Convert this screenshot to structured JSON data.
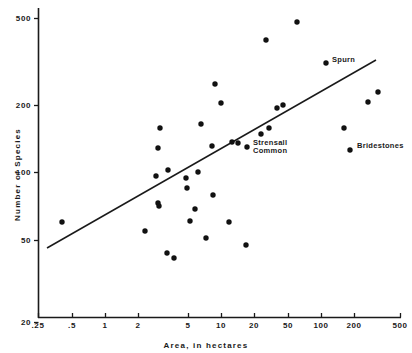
{
  "chart_data": {
    "type": "scatter",
    "title": "",
    "xlabel": "Area, in hectares",
    "ylabel": "Number of Species",
    "xscale": "log",
    "yscale": "log",
    "xlim": [
      0.25,
      500
    ],
    "ylim": [
      20,
      500
    ],
    "grid": false,
    "legend": null,
    "xticks": [
      {
        "value": 0.25,
        "label": ".25",
        "px": 38
      },
      {
        "value": 0.5,
        "label": ".5",
        "px": 72
      },
      {
        "value": 1,
        "label": "1",
        "px": 105
      },
      {
        "value": 2,
        "label": "2",
        "px": 138
      },
      {
        "value": 5,
        "label": "5",
        "px": 188
      },
      {
        "value": 10,
        "label": "10",
        "px": 221
      },
      {
        "value": 20,
        "label": "20",
        "px": 254
      },
      {
        "value": 50,
        "label": "50",
        "px": 288
      },
      {
        "value": 100,
        "label": "100",
        "px": 321
      },
      {
        "value": 200,
        "label": "200",
        "px": 354
      },
      {
        "value": 500,
        "label": "500",
        "px": 400
      }
    ],
    "yticks": [
      {
        "value": 500,
        "label": "500",
        "px": 18
      },
      {
        "value": 200,
        "label": "200",
        "px": 105
      },
      {
        "value": 100,
        "label": "100",
        "px": 172
      },
      {
        "value": 50,
        "label": "50",
        "px": 240
      },
      {
        "value": 20,
        "label": "20",
        "px": 322
      }
    ],
    "points": [
      {
        "x": 0.4,
        "y": 65,
        "px": 62,
        "py": 222,
        "label": null
      },
      {
        "x": 2.4,
        "y": 59,
        "px": 145,
        "py": 231,
        "label": null
      },
      {
        "x": 3.0,
        "y": 96,
        "px": 156,
        "py": 176,
        "label": null
      },
      {
        "x": 3.1,
        "y": 76,
        "px": 158,
        "py": 203,
        "label": null
      },
      {
        "x": 3.1,
        "y": 74,
        "px": 159,
        "py": 206,
        "label": null
      },
      {
        "x": 3.2,
        "y": 155,
        "px": 160,
        "py": 128,
        "label": null
      },
      {
        "x": 3.1,
        "y": 124,
        "px": 158,
        "py": 148,
        "label": null
      },
      {
        "x": 3.9,
        "y": 101,
        "px": 168,
        "py": 170,
        "label": null
      },
      {
        "x": 3.8,
        "y": 42,
        "px": 167,
        "py": 253,
        "label": null
      },
      {
        "x": 4.5,
        "y": 38,
        "px": 174,
        "py": 258,
        "label": null
      },
      {
        "x": 5.6,
        "y": 94,
        "px": 186,
        "py": 178,
        "label": null
      },
      {
        "x": 5.7,
        "y": 86,
        "px": 187,
        "py": 188,
        "label": null
      },
      {
        "x": 6.2,
        "y": 65,
        "px": 190,
        "py": 221,
        "label": null
      },
      {
        "x": 6.9,
        "y": 73,
        "px": 195,
        "py": 209,
        "label": null
      },
      {
        "x": 7.4,
        "y": 99,
        "px": 198,
        "py": 172,
        "label": null
      },
      {
        "x": 7.9,
        "y": 163,
        "px": 201,
        "py": 124,
        "label": null
      },
      {
        "x": 9.0,
        "y": 51,
        "px": 206,
        "py": 238,
        "label": null
      },
      {
        "x": 10.5,
        "y": 81,
        "px": 213,
        "py": 195,
        "label": null
      },
      {
        "x": 10.2,
        "y": 127,
        "px": 212,
        "py": 146,
        "label": null
      },
      {
        "x": 11.0,
        "y": 259,
        "px": 215,
        "py": 84,
        "label": null
      },
      {
        "x": 12.5,
        "y": 205,
        "px": 221,
        "py": 103,
        "label": null
      },
      {
        "x": 15.0,
        "y": 64,
        "px": 229,
        "py": 222,
        "label": null
      },
      {
        "x": 16.5,
        "y": 133,
        "px": 232,
        "py": 142,
        "label": null
      },
      {
        "x": 19.0,
        "y": 132,
        "px": 238,
        "py": 143,
        "label": null
      },
      {
        "x": 23.0,
        "y": 47,
        "px": 246,
        "py": 245,
        "label": null
      },
      {
        "x": 24.0,
        "y": 127,
        "px": 247,
        "py": 147,
        "label": "Strensall\nCommon"
      },
      {
        "x": 33.0,
        "y": 148,
        "px": 261,
        "py": 134,
        "label": null
      },
      {
        "x": 38.0,
        "y": 388,
        "px": 266,
        "py": 40,
        "label": null
      },
      {
        "x": 41.0,
        "y": 160,
        "px": 269,
        "py": 128,
        "label": null
      },
      {
        "x": 50.0,
        "y": 193,
        "px": 277,
        "py": 108,
        "label": null
      },
      {
        "x": 58.0,
        "y": 200,
        "px": 283,
        "py": 105,
        "label": null
      },
      {
        "x": 85.0,
        "y": 470,
        "px": 297,
        "py": 22,
        "label": null
      },
      {
        "x": 95.0,
        "y": 290,
        "px": 326,
        "py": 63,
        "label": "Spurn"
      },
      {
        "x": 150.0,
        "y": 160,
        "px": 344,
        "py": 128,
        "label": null
      },
      {
        "x": 165.0,
        "y": 205,
        "px": 368,
        "py": 102,
        "label": null
      },
      {
        "x": 190.0,
        "y": 122,
        "px": 350,
        "py": 150,
        "label": "Bridestones"
      },
      {
        "x": 240.0,
        "y": 232,
        "px": 378,
        "py": 92,
        "label": null
      }
    ],
    "fit_line": {
      "x_start_px": 47,
      "y_start_px": 248,
      "x_end_px": 376,
      "y_end_px": 60,
      "note": "least-squares regression line"
    },
    "annotations": [
      {
        "text": "Spurn",
        "px": 331,
        "py": 60
      },
      {
        "text": "Strensall",
        "px": 253,
        "py": 144
      },
      {
        "text": "Common",
        "px": 253,
        "py": 152
      },
      {
        "text": "Bridestones",
        "px": 356,
        "py": 146
      }
    ]
  }
}
